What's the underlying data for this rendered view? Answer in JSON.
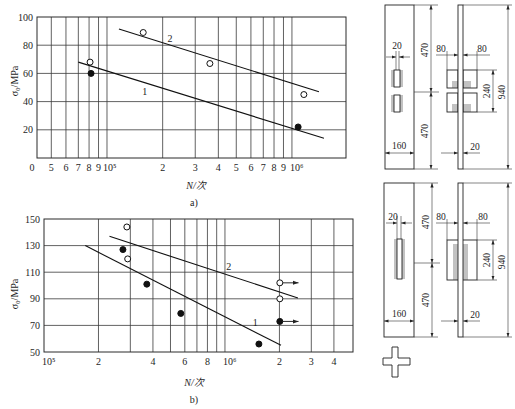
{
  "chart_data": [
    {
      "id": "a",
      "type": "scatter",
      "panel_label": "a)",
      "title": "",
      "xlabel": "N/次",
      "ylabel": "σ₀/MPa",
      "xscale": "log",
      "xlim": [
        41840,
        1960000
      ],
      "ylim": [
        0,
        100
      ],
      "grid": true,
      "origin_label": "0",
      "xticks": [
        {
          "value": 50000,
          "label": "5"
        },
        {
          "value": 60000,
          "label": "6"
        },
        {
          "value": 70000,
          "label": "7"
        },
        {
          "value": 80000,
          "label": "8"
        },
        {
          "value": 90000,
          "label": "9"
        },
        {
          "value": 100000,
          "label": "10⁵"
        },
        {
          "value": 200000,
          "label": "2"
        },
        {
          "value": 300000,
          "label": "3"
        },
        {
          "value": 400000,
          "label": "4"
        },
        {
          "value": 500000,
          "label": "5"
        },
        {
          "value": 600000,
          "label": "6"
        },
        {
          "value": 700000,
          "label": "7"
        },
        {
          "value": 800000,
          "label": "8"
        },
        {
          "value": 900000,
          "label": "9"
        },
        {
          "value": 1000000,
          "label": "10⁶"
        }
      ],
      "xgrid": [
        50000,
        60000,
        70000,
        80000,
        90000,
        100000,
        200000,
        300000,
        400000,
        500000,
        600000,
        700000,
        800000,
        900000,
        1000000
      ],
      "yticks": [
        20,
        40,
        60,
        80,
        100
      ],
      "ygrid": [
        20,
        40,
        60,
        80
      ],
      "series": [
        {
          "name": "1",
          "marker": "filled",
          "points": [
            [
              82000,
              60
            ],
            [
              1080000,
              22
            ]
          ]
        },
        {
          "name": "2",
          "marker": "open",
          "points": [
            [
              81000,
              68
            ],
            [
              157000,
              89
            ],
            [
              360000,
              67
            ],
            [
              1160000,
              45
            ]
          ]
        }
      ],
      "fit_lines": [
        {
          "label": "1",
          "from": [
            70000,
            68
          ],
          "to": [
            1490000,
            14
          ],
          "label_at": [
            160000,
            47
          ]
        },
        {
          "label": "2",
          "from": [
            116000,
            91.5
          ],
          "to": [
            1400000,
            47
          ],
          "label_at": [
            219000,
            85
          ]
        }
      ],
      "runouts": []
    },
    {
      "id": "b",
      "type": "scatter",
      "panel_label": "b)",
      "title": "",
      "xlabel": "N/次",
      "ylabel": "σ₀/MPa",
      "xscale": "log",
      "xlim": [
        100000,
        5100000
      ],
      "ylim": [
        50,
        150
      ],
      "grid": true,
      "origin_label": "",
      "xticks": [
        {
          "value": 100000,
          "label": "10⁵"
        },
        {
          "value": 200000,
          "label": "2"
        },
        {
          "value": 400000,
          "label": "4"
        },
        {
          "value": 600000,
          "label": "6"
        },
        {
          "value": 800000,
          "label": "8"
        },
        {
          "value": 1000000,
          "label": "10⁶"
        },
        {
          "value": 2000000,
          "label": "2"
        },
        {
          "value": 3000000,
          "label": "3"
        },
        {
          "value": 4000000,
          "label": "4"
        }
      ],
      "xgrid": [
        200000,
        300000,
        400000,
        500000,
        600000,
        700000,
        800000,
        900000,
        1000000,
        2000000,
        3000000,
        4000000
      ],
      "yticks": [
        50,
        70,
        90,
        110,
        130,
        150
      ],
      "ygrid": [
        70,
        90,
        110,
        130
      ],
      "series": [
        {
          "name": "1",
          "marker": "filled",
          "points": [
            [
              273000,
              127
            ],
            [
              370000,
              101
            ],
            [
              570000,
              79
            ],
            [
              1540000,
              56
            ],
            [
              2010000,
              73
            ]
          ]
        },
        {
          "name": "2",
          "marker": "open",
          "points": [
            [
              287000,
              144
            ],
            [
              290000,
              120
            ],
            [
              2010000,
              102
            ],
            [
              2010000,
              90
            ]
          ]
        }
      ],
      "fit_lines": [
        {
          "label": "2",
          "from": [
            230000,
            137
          ],
          "to": [
            2530000,
            90.6
          ],
          "label_at": [
            1050000,
            114
          ]
        },
        {
          "label": "1",
          "from": [
            169000,
            130
          ],
          "to": [
            2040000,
            55
          ],
          "label_at": [
            1470000,
            72
          ]
        }
      ],
      "runouts": [
        {
          "from": [
            2010000,
            102
          ],
          "to": [
            2550000,
            102
          ]
        },
        {
          "from": [
            2010000,
            73
          ],
          "to": [
            2550000,
            73
          ]
        }
      ]
    }
  ],
  "specimens": [
    {
      "front": {
        "weld_gap": "20",
        "half_upper": "470",
        "half_lower": "470",
        "width": "160"
      },
      "side": {
        "attach_left": "80",
        "attach_right": "80",
        "attach_length": "240",
        "total_length": "940",
        "thickness": "20"
      }
    },
    {
      "front": {
        "weld_gap": "20",
        "half_upper": "470",
        "half_lower": "470",
        "width": "160"
      },
      "side": {
        "attach_left": "80",
        "attach_right": "80",
        "attach_length": "240",
        "total_length": "940",
        "thickness": "20"
      }
    }
  ]
}
